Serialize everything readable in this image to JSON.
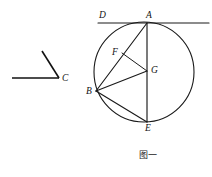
{
  "figure": {
    "caption": "图一",
    "angle_figure": {
      "vertex_label": "C",
      "vertex": {
        "x": 59,
        "y": 78
      },
      "ray_horizontal_end": {
        "x": 12,
        "y": 78
      },
      "ray_upper_end": {
        "x": 42,
        "y": 51
      }
    },
    "circle_figure": {
      "center": {
        "x": 144,
        "y": 72
      },
      "radius": 50,
      "tangent_line": {
        "x1": 98,
        "y1": 23,
        "x2": 209,
        "y2": 23
      },
      "points": [
        {
          "label": "D",
          "x": 101,
          "y": 23,
          "label_dx": -2,
          "label_dy": -12
        },
        {
          "label": "A",
          "x": 147,
          "y": 23,
          "label_dx": -1,
          "label_dy": -12
        },
        {
          "label": "F",
          "x": 122,
          "y": 53,
          "label_dx": -10,
          "label_dy": -5
        },
        {
          "label": "G",
          "x": 147,
          "y": 71,
          "label_dx": 4,
          "label_dy": -5
        },
        {
          "label": "B",
          "x": 96,
          "y": 91,
          "label_dx": -10,
          "label_dy": -4
        },
        {
          "label": "E",
          "x": 147,
          "y": 122,
          "label_dx": -2,
          "label_dy": 2
        }
      ],
      "segments": [
        {
          "name": "A-E",
          "x1": 147,
          "y1": 23,
          "x2": 147,
          "y2": 122
        },
        {
          "name": "A-B",
          "x1": 147,
          "y1": 23,
          "x2": 96,
          "y2": 91
        },
        {
          "name": "F-G",
          "x1": 122,
          "y1": 53,
          "x2": 147,
          "y2": 71
        },
        {
          "name": "B-G",
          "x1": 96,
          "y1": 91,
          "x2": 147,
          "y2": 71
        },
        {
          "name": "B-E",
          "x1": 96,
          "y1": 91,
          "x2": 147,
          "y2": 122
        }
      ]
    },
    "colors": {
      "ink": "#1a1a1a",
      "background": "#ffffff"
    }
  }
}
